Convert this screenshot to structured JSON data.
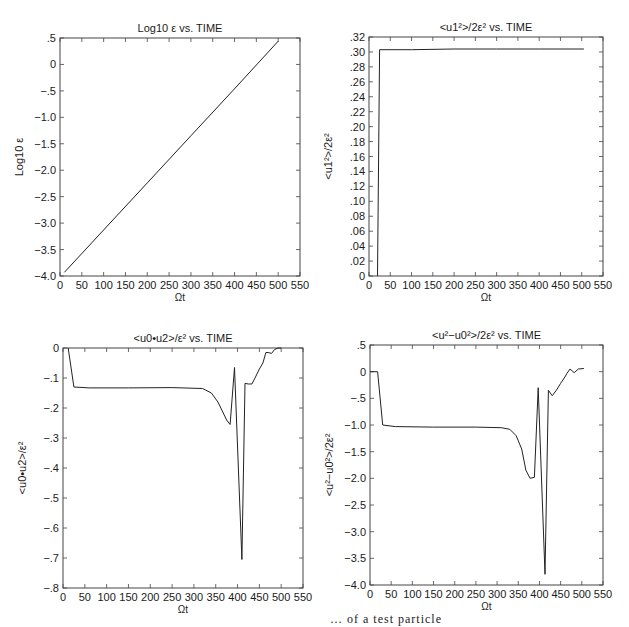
{
  "chart_data": [
    {
      "id": "log-eps",
      "type": "line",
      "title": "Log10 ε  vs. TIME",
      "title_main": "Log",
      "title_sub": "10",
      "title_rest": " ε  vs. TIME",
      "xlabel": "Ωt",
      "ylabel": "Log10 ε",
      "xlim": [
        0,
        550
      ],
      "ylim": [
        -4.0,
        0.5
      ],
      "xticks": [
        0,
        50,
        100,
        150,
        200,
        250,
        300,
        350,
        400,
        450,
        500,
        550
      ],
      "yticks": [
        -4.0,
        -3.5,
        -3.0,
        -2.5,
        -2.0,
        -1.5,
        -1.0,
        -0.5,
        0,
        0.5
      ],
      "ytick_labels": [
        "−4.0",
        "−3.5",
        "−3.0",
        "−2.5",
        "−2.0",
        "−1.5",
        "−1.0",
        "−.5",
        "0",
        ".5"
      ],
      "grid": false,
      "x": [
        10,
        100,
        200,
        300,
        400,
        500
      ],
      "y": [
        -3.93,
        -3.13,
        -2.24,
        -1.35,
        -0.46,
        0.44
      ],
      "frame": {
        "left": 60,
        "top": 38,
        "right": 300,
        "bottom": 276
      }
    },
    {
      "id": "u1-energy",
      "type": "line",
      "title": "<u1²>/2ε²  vs. TIME",
      "xlabel": "Ωt",
      "ylabel": "<u1²>/2ε²",
      "xlim": [
        0,
        550
      ],
      "ylim": [
        0,
        0.32
      ],
      "xticks": [
        0,
        50,
        100,
        150,
        200,
        250,
        300,
        350,
        400,
        450,
        500,
        550
      ],
      "yticks": [
        0,
        0.02,
        0.04,
        0.06,
        0.08,
        0.1,
        0.12,
        0.14,
        0.16,
        0.18,
        0.2,
        0.22,
        0.24,
        0.26,
        0.28,
        0.3,
        0.32
      ],
      "ytick_labels": [
        "0",
        ".02",
        ".04",
        ".06",
        ".08",
        ".10",
        ".12",
        ".14",
        ".16",
        ".18",
        ".20",
        ".22",
        ".24",
        ".26",
        ".28",
        ".30",
        ".32"
      ],
      "grid": false,
      "x": [
        20,
        25,
        100,
        200,
        300,
        400,
        505
      ],
      "y": [
        0,
        0.303,
        0.303,
        0.304,
        0.304,
        0.304,
        0.304
      ],
      "frame": {
        "left": 369,
        "top": 37,
        "right": 603,
        "bottom": 276
      }
    },
    {
      "id": "u0u2",
      "type": "line",
      "title": "<u0•u2>/ε²  vs. TIME",
      "xlabel": "Ωt",
      "ylabel": "<u0•u2>/ε²",
      "xlim": [
        0,
        550
      ],
      "ylim": [
        -0.8,
        0
      ],
      "xticks": [
        0,
        50,
        100,
        150,
        200,
        250,
        300,
        350,
        400,
        450,
        500,
        550
      ],
      "yticks": [
        -0.8,
        -0.7,
        -0.6,
        -0.5,
        -0.4,
        -0.3,
        -0.2,
        -0.1,
        0
      ],
      "ytick_labels": [
        "−.8",
        "−.7",
        "−.6",
        "−.5",
        "−.4",
        "−.3",
        "−.2",
        "−.1",
        "0"
      ],
      "grid": false,
      "x": [
        12,
        25,
        60,
        150,
        250,
        320,
        340,
        355,
        365,
        375,
        383,
        393,
        410,
        417,
        425,
        433,
        440,
        450,
        458,
        465,
        470,
        478,
        485,
        493,
        500
      ],
      "y": [
        0,
        -0.13,
        -0.133,
        -0.133,
        -0.132,
        -0.135,
        -0.15,
        -0.18,
        -0.21,
        -0.24,
        -0.255,
        -0.065,
        -0.705,
        -0.118,
        -0.12,
        -0.12,
        -0.1,
        -0.07,
        -0.05,
        -0.015,
        -0.015,
        -0.018,
        -0.005,
        0,
        0
      ],
      "frame": {
        "left": 63,
        "top": 348,
        "right": 303,
        "bottom": 588
      }
    },
    {
      "id": "u2-u0sq",
      "type": "line",
      "title": "<u²−u0²>/2ε² vs. TIME",
      "xlabel": "Ωt",
      "ylabel": "<u²−u0²>/2ε²",
      "xlim": [
        0,
        550
      ],
      "ylim": [
        -4.0,
        0.5
      ],
      "xticks": [
        0,
        50,
        100,
        150,
        200,
        250,
        300,
        350,
        400,
        450,
        500,
        550
      ],
      "yticks": [
        -4.0,
        -3.5,
        -3.0,
        -2.5,
        -2.0,
        -1.5,
        -1.0,
        -0.5,
        0,
        0.5
      ],
      "ytick_labels": [
        "−4.0",
        "−3.5",
        "−3.0",
        "−2.5",
        "−2.0",
        "−1.5",
        "−1.0",
        "−.5",
        "0",
        ".5"
      ],
      "grid": false,
      "x": [
        0,
        18,
        30,
        60,
        150,
        250,
        310,
        330,
        345,
        358,
        368,
        378,
        388,
        397,
        413,
        421,
        430,
        440,
        450,
        460,
        465,
        472,
        482,
        492,
        505
      ],
      "y": [
        0,
        0,
        -1.0,
        -1.03,
        -1.04,
        -1.04,
        -1.05,
        -1.08,
        -1.2,
        -1.45,
        -1.85,
        -2.0,
        -1.98,
        -0.3,
        -3.8,
        -0.35,
        -0.45,
        -0.35,
        -0.22,
        -0.1,
        -0.03,
        0.05,
        -0.02,
        0.05,
        0.06
      ],
      "frame": {
        "left": 370,
        "top": 345,
        "right": 603,
        "bottom": 585
      }
    }
  ],
  "caption": "… of a test particle"
}
